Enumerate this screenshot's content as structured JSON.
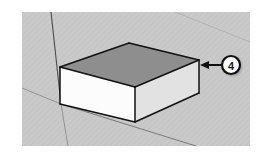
{
  "figure": {
    "canvas": {
      "width": 262,
      "height": 155,
      "page_background": "#ffffff"
    },
    "viewport": {
      "label": "3d-modeling-viewport",
      "x": 22,
      "y": 12,
      "width": 228,
      "height": 134,
      "background_color": "#c9c9c9",
      "texture": "fine-diagonal-hatch",
      "texture_color": "#bfbfbf"
    }
  },
  "axes": [
    {
      "name": "blue-axis",
      "description": "vertical axis line",
      "color": "#4a4a4a",
      "x1": 51,
      "y1": 12,
      "x2": 61,
      "y2": 104,
      "width": 1.1
    },
    {
      "name": "green-axis",
      "description": "axis receding to lower right",
      "color": "#6f6f6f",
      "x1": 61,
      "y1": 104,
      "x2": 196,
      "y2": 146,
      "width": 0.9
    },
    {
      "name": "red-axis",
      "description": "axis receding to upper left",
      "color": "#8d8d8d",
      "x1": 22,
      "y1": 88,
      "x2": 61,
      "y2": 104,
      "width": 0.9
    },
    {
      "name": "green-axis-extension",
      "description": "axis continuing below origin",
      "color": "#8d8d8d",
      "x1": 61,
      "y1": 104,
      "x2": 68,
      "y2": 146,
      "width": 0.9
    },
    {
      "name": "horizon-line",
      "description": "faint guide across upper right",
      "color": "#b0b0b0",
      "x1": 175,
      "y1": 12,
      "x2": 250,
      "y2": 42,
      "width": 0.9
    }
  ],
  "box": {
    "name": "extruded-rectangle-solid",
    "outline_color": "#111111",
    "outline_width": 1.5,
    "faces": {
      "top": {
        "name": "top-face",
        "fill": "#8e8e8e",
        "points": "60,67 129,43 199,60 135,87"
      },
      "front_left": {
        "name": "front-left-face",
        "fill": "#fcfcfc",
        "points": "60,67 135,87 135,122 60,104"
      },
      "front_right": {
        "name": "front-right-face",
        "fill": "#e2e2e2",
        "points": "135,87 199,60 199,93 135,122"
      }
    },
    "edges": [
      {
        "name": "top-back-left-edge",
        "x1": 60,
        "y1": 67,
        "x2": 129,
        "y2": 43
      },
      {
        "name": "top-back-right-edge",
        "x1": 129,
        "y1": 43,
        "x2": 199,
        "y2": 60
      },
      {
        "name": "top-front-right-edge",
        "x1": 199,
        "y1": 60,
        "x2": 135,
        "y2": 87
      },
      {
        "name": "top-front-left-edge",
        "x1": 135,
        "y1": 87,
        "x2": 60,
        "y2": 67
      },
      {
        "name": "left-vertical-edge",
        "x1": 60,
        "y1": 67,
        "x2": 60,
        "y2": 104
      },
      {
        "name": "front-vertical-edge",
        "x1": 135,
        "y1": 87,
        "x2": 135,
        "y2": 122
      },
      {
        "name": "right-vertical-edge",
        "x1": 199,
        "y1": 60,
        "x2": 199,
        "y2": 93
      },
      {
        "name": "bottom-left-edge",
        "x1": 60,
        "y1": 104,
        "x2": 135,
        "y2": 122
      },
      {
        "name": "bottom-right-edge",
        "x1": 135,
        "y1": 122,
        "x2": 199,
        "y2": 93
      }
    ]
  },
  "callout": {
    "name": "callout-4",
    "number": "4",
    "circle": {
      "cx": 231,
      "cy": 65,
      "r": 9,
      "fill": "#ffffff",
      "stroke": "#111111",
      "stroke_width": 2.2,
      "shadow_color": "#6d6d6d"
    },
    "leader": {
      "name": "callout-leader-arrow",
      "color": "#111111",
      "width": 2,
      "x1": 222,
      "y1": 65,
      "x2": 203,
      "y2": 65,
      "arrow_points": "200,65 209,61 209,69"
    },
    "target_description": "right vertical edge of the box"
  }
}
